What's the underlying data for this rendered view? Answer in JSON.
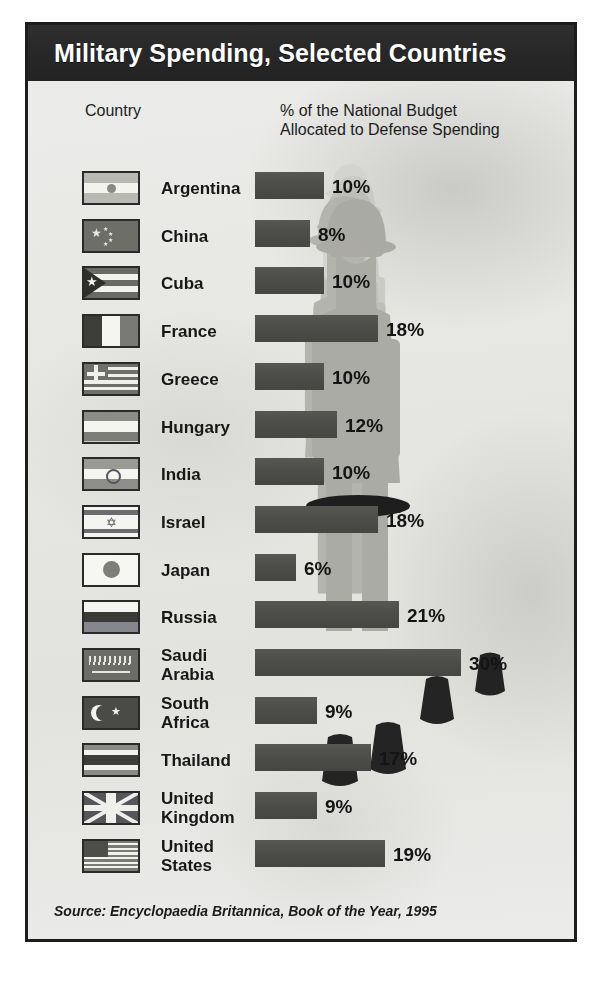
{
  "header": {
    "title": "Military Spending, Selected Countries"
  },
  "columns": {
    "country": "Country",
    "metric_line1": "% of the National Budget",
    "metric_line2": "Allocated to Defense Spending"
  },
  "source": "Source: Encyclopaedia Britannica, Book of the Year, 1995",
  "colors": {
    "header_bg": "#272727",
    "bar": "#4c4c49",
    "paper_bg": "#e8e8e6",
    "frame": "#1d1d1d",
    "text": "#171717"
  },
  "chart_data": {
    "type": "bar",
    "title": "Military Spending, Selected Countries",
    "xlabel": "% of the National Budget Allocated to Defense Spending",
    "ylabel": "Country",
    "orientation": "horizontal",
    "unit": "%",
    "xlim": [
      0,
      30
    ],
    "grid": false,
    "legend": "none",
    "source": "Source: Encyclopaedia Britannica, Book of the Year, 1995",
    "categories": [
      "Argentina",
      "China",
      "Cuba",
      "France",
      "Greece",
      "Hungary",
      "India",
      "Israel",
      "Japan",
      "Russia",
      "Saudi Arabia",
      "South Africa",
      "Thailand",
      "United Kingdom",
      "United States"
    ],
    "values": [
      10,
      8,
      10,
      18,
      10,
      12,
      10,
      18,
      6,
      21,
      30,
      9,
      17,
      9,
      19
    ],
    "labels": [
      "10%",
      "8%",
      "10%",
      "18%",
      "10%",
      "12%",
      "10%",
      "18%",
      "6%",
      "21%",
      "30%",
      "9%",
      "17%",
      "9%",
      "19%"
    ]
  },
  "rows": [
    {
      "name": "Argentina",
      "name_line1": "Argentina",
      "name_line2": "",
      "value": 10,
      "label": "10%",
      "flag": "flag-argentina"
    },
    {
      "name": "China",
      "name_line1": "China",
      "name_line2": "",
      "value": 8,
      "label": "8%",
      "flag": "flag-china"
    },
    {
      "name": "Cuba",
      "name_line1": "Cuba",
      "name_line2": "",
      "value": 10,
      "label": "10%",
      "flag": "flag-cuba"
    },
    {
      "name": "France",
      "name_line1": "France",
      "name_line2": "",
      "value": 18,
      "label": "18%",
      "flag": "flag-france"
    },
    {
      "name": "Greece",
      "name_line1": "Greece",
      "name_line2": "",
      "value": 10,
      "label": "10%",
      "flag": "flag-greece"
    },
    {
      "name": "Hungary",
      "name_line1": "Hungary",
      "name_line2": "",
      "value": 12,
      "label": "12%",
      "flag": "flag-hungary"
    },
    {
      "name": "India",
      "name_line1": "India",
      "name_line2": "",
      "value": 10,
      "label": "10%",
      "flag": "flag-india"
    },
    {
      "name": "Israel",
      "name_line1": "Israel",
      "name_line2": "",
      "value": 18,
      "label": "18%",
      "flag": "flag-israel"
    },
    {
      "name": "Japan",
      "name_line1": "Japan",
      "name_line2": "",
      "value": 6,
      "label": "6%",
      "flag": "flag-japan"
    },
    {
      "name": "Russia",
      "name_line1": "Russia",
      "name_line2": "",
      "value": 21,
      "label": "21%",
      "flag": "flag-russia"
    },
    {
      "name": "Saudi Arabia",
      "name_line1": "Saudi",
      "name_line2": "Arabia",
      "value": 30,
      "label": "30%",
      "flag": "flag-saudi-arabia"
    },
    {
      "name": "South Africa",
      "name_line1": "South",
      "name_line2": "Africa",
      "value": 9,
      "label": "9%",
      "flag": "flag-south-africa"
    },
    {
      "name": "Thailand",
      "name_line1": "Thailand",
      "name_line2": "",
      "value": 17,
      "label": "17%",
      "flag": "flag-thailand"
    },
    {
      "name": "United Kingdom",
      "name_line1": "United",
      "name_line2": "Kingdom",
      "value": 9,
      "label": "9%",
      "flag": "flag-united-kingdom"
    },
    {
      "name": "United States",
      "name_line1": "United",
      "name_line2": "States",
      "value": 19,
      "label": "19%",
      "flag": "flag-united-states"
    }
  ]
}
